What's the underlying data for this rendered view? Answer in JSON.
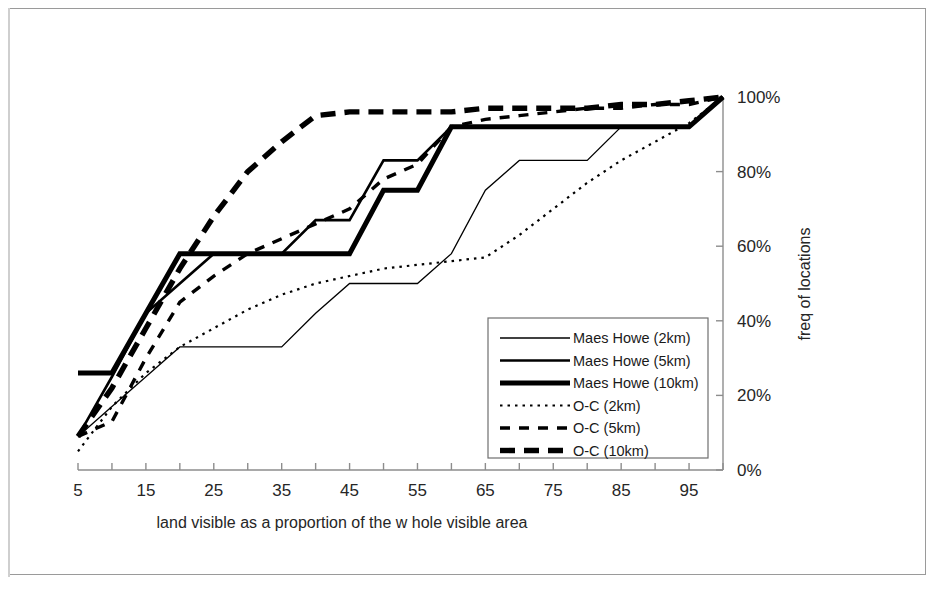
{
  "figure": {
    "kind": "scanned-figure",
    "has_border": true
  },
  "axes": {
    "x_title": "land visible as a proportion of the w hole visible area",
    "y_title": "freq of locations",
    "x_tick_labels": [
      "5",
      "15",
      "25",
      "35",
      "45",
      "55",
      "65",
      "75",
      "85",
      "95"
    ],
    "y_tick_labels": [
      "0%",
      "20%",
      "40%",
      "60%",
      "80%",
      "100%"
    ],
    "y_axis_side": "right"
  },
  "legend": {
    "items": [
      {
        "label": "Maes Howe (2km)",
        "style": "thin-solid"
      },
      {
        "label": "Maes Howe (5km)",
        "style": "medium-solid"
      },
      {
        "label": "Maes Howe (10km)",
        "style": "heavy-solid"
      },
      {
        "label": "O-C (2km)",
        "style": "fine-dotted"
      },
      {
        "label": "O-C (5km)",
        "style": "medium-dashed"
      },
      {
        "label": "O-C (10km)",
        "style": "heavy-dashed"
      }
    ]
  },
  "chart_data": {
    "type": "line",
    "title": "",
    "xlabel": "land visible as a proportion of the w hole visible area",
    "ylabel": "freq of locations",
    "xlim": [
      5,
      100
    ],
    "ylim": [
      0,
      100
    ],
    "xticks": [
      5,
      15,
      25,
      35,
      45,
      55,
      65,
      75,
      85,
      95
    ],
    "xminorticks": [
      10,
      20,
      30,
      40,
      50,
      60,
      70,
      80,
      90,
      100
    ],
    "yticks": [
      0,
      20,
      40,
      60,
      80,
      100
    ],
    "ytick_format": "percent",
    "grid": false,
    "legend_position": "center-right",
    "x": [
      5,
      10,
      15,
      20,
      25,
      30,
      35,
      40,
      45,
      50,
      55,
      60,
      65,
      70,
      75,
      80,
      85,
      90,
      95,
      100
    ],
    "series": [
      {
        "name": "Maes Howe (2km)",
        "style": "thin-solid",
        "values": [
          9,
          17,
          25,
          33,
          33,
          33,
          33,
          42,
          50,
          50,
          50,
          58,
          75,
          83,
          83,
          83,
          92,
          92,
          92,
          100
        ]
      },
      {
        "name": "Maes Howe (5km)",
        "style": "medium-solid",
        "values": [
          9,
          25,
          42,
          50,
          58,
          58,
          58,
          67,
          67,
          83,
          83,
          92,
          92,
          92,
          92,
          92,
          92,
          92,
          92,
          100
        ]
      },
      {
        "name": "Maes Howe (10km)",
        "style": "heavy-solid",
        "values": [
          26,
          26,
          42,
          58,
          58,
          58,
          58,
          58,
          58,
          75,
          75,
          92,
          92,
          92,
          92,
          92,
          92,
          92,
          92,
          100
        ]
      },
      {
        "name": "O-C (2km)",
        "style": "fine-dotted",
        "values": [
          5,
          17,
          26,
          33,
          38,
          43,
          47,
          50,
          52,
          54,
          55,
          56,
          57,
          63,
          70,
          77,
          83,
          88,
          93,
          100
        ]
      },
      {
        "name": "O-C (5km)",
        "style": "medium-dashed",
        "values": [
          9,
          13,
          30,
          45,
          52,
          58,
          62,
          66,
          70,
          78,
          82,
          92,
          94,
          95,
          96,
          97,
          97,
          98,
          98,
          100
        ]
      },
      {
        "name": "O-C (10km)",
        "style": "heavy-dashed",
        "values": [
          9,
          22,
          38,
          54,
          68,
          80,
          88,
          95,
          96,
          96,
          96,
          96,
          97,
          97,
          97,
          97,
          98,
          98,
          99,
          100
        ]
      }
    ]
  }
}
